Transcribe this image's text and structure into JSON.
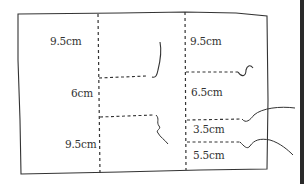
{
  "diagram": {
    "type": "cutting-pattern-sketch",
    "left_column": {
      "labels": [
        "9.5cm",
        "6cm",
        "9.5cm"
      ]
    },
    "right_column": {
      "labels": [
        "9.5cm",
        "6.5cm",
        "3.5cm",
        "5.5cm"
      ]
    },
    "colors": {
      "line": "#333333",
      "background": "#ffffff",
      "edge_bar": "#2a2a2a"
    }
  }
}
